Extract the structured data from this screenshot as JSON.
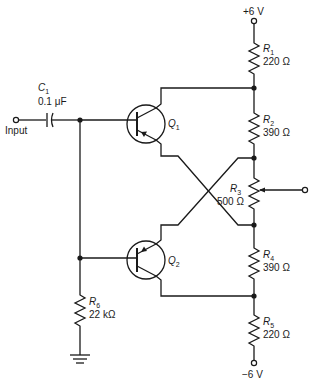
{
  "power": {
    "positive": "+6 V",
    "negative": "−6 V"
  },
  "input": {
    "label": "Input"
  },
  "capacitor": {
    "name": "C",
    "sub": "1",
    "value": "0.1 μF"
  },
  "transistors": [
    {
      "name": "Q",
      "sub": "1",
      "type": "PNP"
    },
    {
      "name": "Q",
      "sub": "2",
      "type": "PNP"
    }
  ],
  "resistors": [
    {
      "name": "R",
      "sub": "1",
      "value": "220 Ω"
    },
    {
      "name": "R",
      "sub": "2",
      "value": "390 Ω"
    },
    {
      "name": "R",
      "sub": "3",
      "value": "500 Ω",
      "kind": "potentiometer"
    },
    {
      "name": "R",
      "sub": "4",
      "value": "390 Ω"
    },
    {
      "name": "R",
      "sub": "5",
      "value": "220 Ω"
    },
    {
      "name": "R",
      "sub": "6",
      "value": "22 kΩ"
    }
  ],
  "colors": {
    "ink": "#1a1a1a",
    "background": "#ffffff"
  }
}
